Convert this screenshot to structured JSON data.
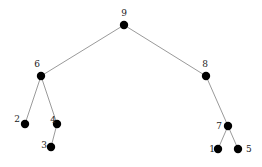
{
  "diagram": {
    "type": "tree",
    "nodes": [
      {
        "id": "9",
        "label": "9"
      },
      {
        "id": "6",
        "label": "6"
      },
      {
        "id": "8",
        "label": "8"
      },
      {
        "id": "2",
        "label": "2"
      },
      {
        "id": "4",
        "label": "4"
      },
      {
        "id": "3",
        "label": "3"
      },
      {
        "id": "7",
        "label": "7"
      },
      {
        "id": "1",
        "label": "1"
      },
      {
        "id": "5",
        "label": "5"
      }
    ],
    "edges": [
      {
        "from": "9",
        "to": "6"
      },
      {
        "from": "9",
        "to": "8"
      },
      {
        "from": "6",
        "to": "2"
      },
      {
        "from": "6",
        "to": "4"
      },
      {
        "from": "4",
        "to": "3"
      },
      {
        "from": "8",
        "to": "7"
      },
      {
        "from": "7",
        "to": "1"
      },
      {
        "from": "7",
        "to": "5"
      }
    ],
    "colors": {
      "node": "#000000",
      "edge": "#9a9a9a",
      "label": "#222222"
    }
  }
}
